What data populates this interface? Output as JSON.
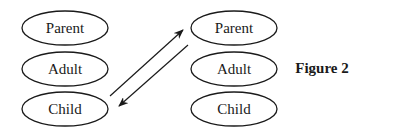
{
  "diagram": {
    "left_column": [
      {
        "label": "Parent"
      },
      {
        "label": "Adult"
      },
      {
        "label": "Child"
      }
    ],
    "right_column": [
      {
        "label": "Parent"
      },
      {
        "label": "Adult"
      },
      {
        "label": "Child"
      }
    ],
    "arrows": [
      {
        "from": "left.Child",
        "to": "right.Parent"
      },
      {
        "from": "right.Parent",
        "to": "left.Child"
      }
    ],
    "figure_label": "Figure 2"
  }
}
